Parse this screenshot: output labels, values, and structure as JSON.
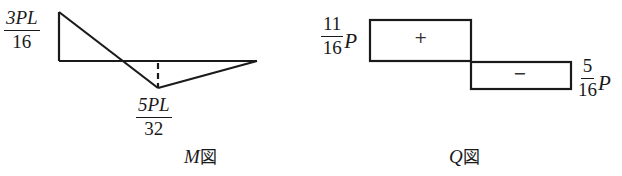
{
  "moment_diagram": {
    "caption_symbol": "M",
    "caption_suffix": "図",
    "max_label": {
      "numerator": "3PL",
      "denominator": "16"
    },
    "min_label": {
      "numerator": "5PL",
      "denominator": "32"
    }
  },
  "shear_diagram": {
    "caption_symbol": "Q",
    "caption_suffix": "図",
    "positive_label": {
      "numerator": "11",
      "denominator": "16",
      "variable": "P"
    },
    "negative_label": {
      "numerator": "5",
      "denominator": "16",
      "variable": "P"
    },
    "positive_sign": "+",
    "negative_sign": "−"
  },
  "colors": {
    "line": "#1a1a1a",
    "background": "#ffffff"
  }
}
